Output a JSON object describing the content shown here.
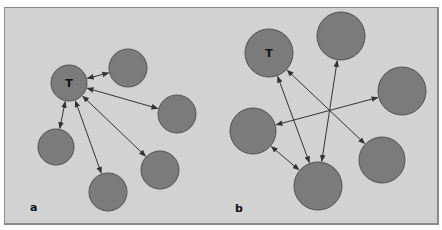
{
  "colors": {
    "background": "#d2d2d2",
    "frame_border": "#8a8a8a",
    "node_fill": "#7b7b7b",
    "node_stroke": "#505050",
    "edge": "#333333"
  },
  "panels": [
    {
      "id": "a",
      "label": "a",
      "label_pos": [
        30,
        211
      ],
      "nodes": [
        {
          "id": "T",
          "label": "T",
          "cx": 69,
          "cy": 83,
          "r": 18
        },
        {
          "id": "n1",
          "label": "",
          "cx": 128,
          "cy": 68,
          "r": 19
        },
        {
          "id": "n2",
          "label": "",
          "cx": 177,
          "cy": 114,
          "r": 19
        },
        {
          "id": "n3",
          "label": "",
          "cx": 160,
          "cy": 170,
          "r": 19
        },
        {
          "id": "n4",
          "label": "",
          "cx": 108,
          "cy": 192,
          "r": 19
        },
        {
          "id": "n5",
          "label": "",
          "cx": 56,
          "cy": 147,
          "r": 18
        }
      ],
      "edges": [
        {
          "from": "T",
          "to": "n1",
          "bidirectional": true
        },
        {
          "from": "T",
          "to": "n2",
          "bidirectional": true
        },
        {
          "from": "T",
          "to": "n3",
          "bidirectional": true
        },
        {
          "from": "T",
          "to": "n4",
          "bidirectional": true
        },
        {
          "from": "T",
          "to": "n5",
          "bidirectional": true
        }
      ]
    },
    {
      "id": "b",
      "label": "b",
      "label_pos": [
        235,
        212
      ],
      "nodes": [
        {
          "id": "T",
          "label": "T",
          "cx": 269,
          "cy": 53,
          "r": 24
        },
        {
          "id": "m1",
          "label": "",
          "cx": 341,
          "cy": 36,
          "r": 24
        },
        {
          "id": "m2",
          "label": "",
          "cx": 402,
          "cy": 91,
          "r": 24
        },
        {
          "id": "m3",
          "label": "",
          "cx": 382,
          "cy": 160,
          "r": 23
        },
        {
          "id": "m4",
          "label": "",
          "cx": 318,
          "cy": 186,
          "r": 24
        },
        {
          "id": "m5",
          "label": "",
          "cx": 253,
          "cy": 131,
          "r": 23
        }
      ],
      "edges": [
        {
          "from": "T",
          "to": "m4",
          "bidirectional": true
        },
        {
          "from": "T",
          "to": "m3",
          "bidirectional": true
        },
        {
          "from": "m1",
          "to": "m4",
          "bidirectional": true
        },
        {
          "from": "m5",
          "to": "m2",
          "bidirectional": true
        },
        {
          "from": "m5",
          "to": "m4",
          "bidirectional": true
        }
      ]
    }
  ]
}
